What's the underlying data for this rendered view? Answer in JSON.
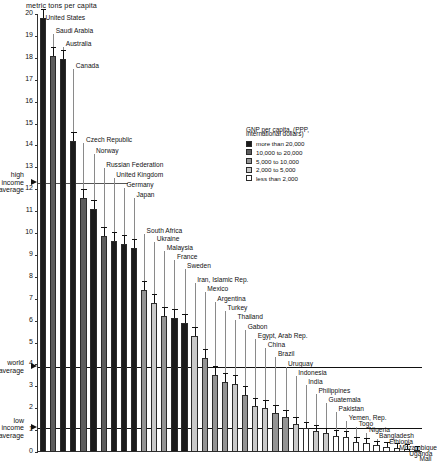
{
  "chart_data": {
    "type": "bar",
    "title": "metric tons per capita",
    "xlabel": "",
    "ylabel": "metric tons per capita",
    "ylim": [
      0,
      20
    ],
    "ytick_labels": [
      "20",
      "19",
      "18",
      "17",
      "16",
      "15",
      "14",
      "13",
      "12",
      "11",
      "10",
      "9",
      "8",
      "7",
      "6",
      "5",
      "4",
      "3",
      "2",
      "1",
      "0"
    ],
    "grid": false,
    "categories": [
      "United States",
      "Saudi Arabia",
      "Australia",
      "Canada",
      "Czech Republic",
      "Norway",
      "Russian Federation",
      "United Kingdom",
      "Germany",
      "Japan",
      "South Africa",
      "Ukraine",
      "Malaysia",
      "France",
      "Sweden",
      "Iran, Islamic Rep.",
      "Mexico",
      "Argentina",
      "Turkey",
      "Thailand",
      "Gabon",
      "Egypt, Arab Rep.",
      "China",
      "Brazil",
      "Uruguay",
      "Indonesia",
      "India",
      "Philippines",
      "Guatemala",
      "Pakistan",
      "Yemen, Rep.",
      "Togo",
      "Nigeria",
      "Bangladesh",
      "Ethiopia",
      "Mozambique",
      "Uganda",
      "Mali"
    ],
    "values": [
      19.8,
      18.1,
      17.95,
      14.2,
      11.6,
      11.1,
      9.85,
      9.65,
      9.5,
      9.3,
      7.4,
      6.8,
      6.2,
      6.1,
      5.9,
      5.3,
      4.3,
      3.5,
      3.2,
      3.1,
      2.6,
      2.1,
      2.0,
      1.8,
      1.6,
      1.3,
      1.1,
      0.95,
      0.85,
      0.75,
      0.7,
      0.45,
      0.4,
      0.3,
      0.25,
      0.2,
      0.15,
      0.1
    ],
    "group_index": [
      0,
      1,
      0,
      0,
      1,
      0,
      1,
      0,
      0,
      0,
      2,
      3,
      2,
      0,
      0,
      3,
      2,
      2,
      2,
      3,
      2,
      3,
      3,
      2,
      2,
      3,
      4,
      3,
      3,
      4,
      4,
      4,
      4,
      4,
      4,
      4,
      4,
      4
    ],
    "reference_lines": [
      {
        "label": "high income average",
        "value": 12.3
      },
      {
        "label": "world average",
        "value": 3.9
      },
      {
        "label": "low income average",
        "value": 1.1
      }
    ]
  },
  "legend": {
    "title_line1": "GNP per capita, (PPP,",
    "title_line2": "international dollars)",
    "entries": [
      {
        "label": "more than 20,000",
        "color": "#1b1b1b"
      },
      {
        "label": "10,000 to 20,000",
        "color": "#5d5d5d"
      },
      {
        "label": "5,000 to 10,000",
        "color": "#949494"
      },
      {
        "label": "2,000 to 5,000",
        "color": "#c9c9c9"
      },
      {
        "label": "less than 2,000",
        "color": "#ffffff"
      }
    ]
  }
}
